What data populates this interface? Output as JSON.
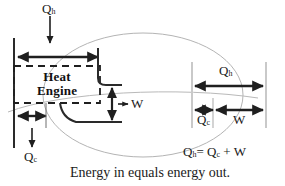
{
  "figure": {
    "type": "diagram",
    "caption": "Energy in equals energy out.",
    "equation": {
      "lhs": "Q",
      "lhs_sub": "h",
      "eq": "=",
      "rhs1": "Q",
      "rhs1_sub": "c",
      "plus": "+",
      "rhs2": "W"
    },
    "box": {
      "label_line1": "Heat",
      "label_line2": "Engine"
    },
    "labels": {
      "q_hot_top": {
        "text": "Q",
        "sub": "h"
      },
      "q_cold_bottom": {
        "text": "Q",
        "sub": "c"
      },
      "work_center": {
        "text": "W"
      },
      "q_hot_bar": {
        "text": "Q",
        "sub": "h"
      },
      "q_cold_bar": {
        "text": "Q",
        "sub": "c"
      },
      "work_bar": {
        "text": "W"
      }
    },
    "colors": {
      "ink": "#1a1a1a",
      "stroke": "#222222",
      "ellipse": "#b0b0b0",
      "guide": "#c8c8c8",
      "background": "#ffffff"
    },
    "bar_values": {
      "q_hot": 1.0,
      "q_cold": 0.28,
      "work": 0.72
    }
  }
}
